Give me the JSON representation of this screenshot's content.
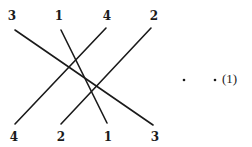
{
  "diagram": {
    "top_row": [
      {
        "label": "3",
        "x": 12
      },
      {
        "label": "1",
        "x": 59
      },
      {
        "label": "4",
        "x": 107
      },
      {
        "label": "2",
        "x": 154
      }
    ],
    "bottom_row": [
      {
        "label": "4",
        "x": 14
      },
      {
        "label": "2",
        "x": 61
      },
      {
        "label": "1",
        "x": 108
      },
      {
        "label": "3",
        "x": 155
      }
    ],
    "connections": [
      {
        "value": "3",
        "x1": 15,
        "y1": 30,
        "x2": 153,
        "y2": 125
      },
      {
        "value": "1",
        "x1": 61,
        "y1": 30,
        "x2": 107,
        "y2": 123
      },
      {
        "value": "4",
        "x1": 106,
        "y1": 28,
        "x2": 15,
        "y2": 124
      },
      {
        "value": "2",
        "x1": 151,
        "y1": 28,
        "x2": 61,
        "y2": 124
      }
    ],
    "equation_label": "(1)",
    "dots": [
      "·",
      "·"
    ],
    "colors": {
      "ink": "#1a1a1a",
      "background": "#ffffff"
    }
  }
}
